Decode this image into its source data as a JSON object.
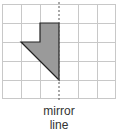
{
  "diagram": {
    "type": "reflection-grid",
    "grid": {
      "columns": 6,
      "rows": 5,
      "cell_size_px": 19,
      "origin": [
        2,
        4
      ],
      "line_color": "#c8c8c8"
    },
    "mirror_line": {
      "orientation": "vertical",
      "grid_x": 3,
      "style": "dashed",
      "color": "#555555"
    },
    "shape": {
      "fill": "#9a9a9a",
      "stroke": "#222222",
      "vertices_grid": [
        [
          2,
          1
        ],
        [
          3,
          1
        ],
        [
          3,
          4
        ],
        [
          1,
          2
        ],
        [
          2,
          2
        ]
      ]
    },
    "label_line1": "mirror",
    "label_line2": "line"
  }
}
